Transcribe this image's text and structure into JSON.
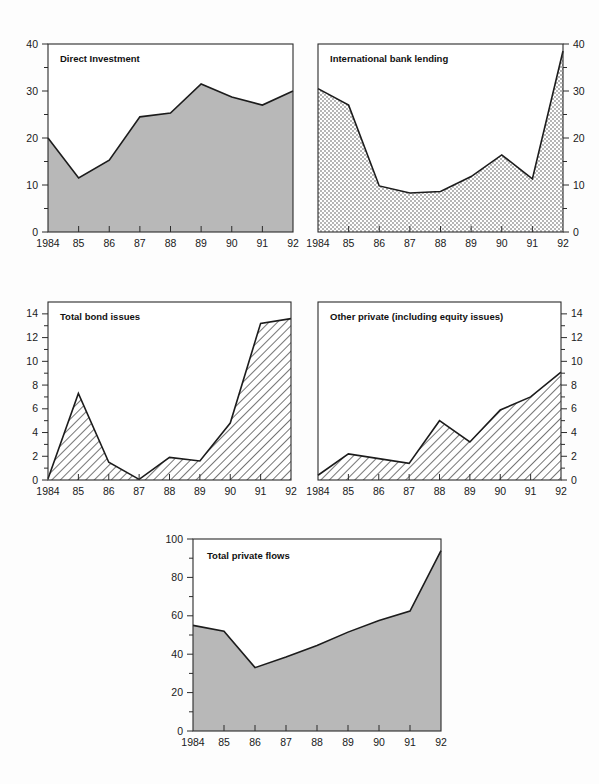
{
  "page": {
    "background_color": "#fdfdfd",
    "text_color": "#111111",
    "axis_color": "#2b2b2b",
    "solid_fill_color": "#b8b8b8",
    "line_color": "#1c1c1c"
  },
  "charts": [
    {
      "id": "direct-investment",
      "title": "Direct Investment",
      "fill_style": "solid-gray",
      "y_axis_side": "left",
      "chart_data": {
        "type": "area",
        "title": "Direct Investment",
        "xlabel": "",
        "ylabel": "",
        "categories": [
          "1984",
          "85",
          "86",
          "87",
          "88",
          "89",
          "90",
          "91",
          "92"
        ],
        "values": [
          20,
          11.5,
          15.3,
          24.5,
          25.3,
          31.5,
          28.7,
          27,
          30
        ],
        "ylim": [
          0,
          40
        ],
        "yticks": [
          0,
          10,
          20,
          30,
          40
        ],
        "yticklabels": [
          "0",
          "10",
          "20",
          "30",
          "40"
        ],
        "minor_yticks": [
          5,
          15,
          25,
          35
        ],
        "grid": false,
        "legend": "none"
      }
    },
    {
      "id": "international-bank-lending",
      "title": "International bank lending",
      "fill_style": "dotted-stipple",
      "y_axis_side": "right",
      "chart_data": {
        "type": "area",
        "title": "International bank lending",
        "xlabel": "",
        "ylabel": "",
        "categories": [
          "1984",
          "85",
          "86",
          "87",
          "88",
          "89",
          "90",
          "91",
          "92"
        ],
        "values": [
          30.5,
          27,
          9.8,
          8.3,
          8.6,
          11.8,
          16.4,
          11.3,
          38.5
        ],
        "ylim": [
          0,
          40
        ],
        "yticks": [
          0,
          10,
          20,
          30,
          40
        ],
        "yticklabels": [
          "0",
          "10",
          "20",
          "30",
          "40"
        ],
        "minor_yticks": [
          5,
          15,
          25,
          35
        ],
        "grid": false,
        "legend": "none"
      }
    },
    {
      "id": "total-bond-issues",
      "title": "Total bond issues",
      "fill_style": "diagonal-hatch",
      "y_axis_side": "left",
      "chart_data": {
        "type": "area",
        "title": "Total bond issues",
        "xlabel": "",
        "ylabel": "",
        "categories": [
          "1984",
          "85",
          "86",
          "87",
          "88",
          "89",
          "90",
          "91",
          "92"
        ],
        "values": [
          0.1,
          7.3,
          1.5,
          0.05,
          1.9,
          1.6,
          4.8,
          13.2,
          13.6
        ],
        "ylim": [
          0,
          15
        ],
        "yticks": [
          0,
          2,
          4,
          6,
          8,
          10,
          12,
          14
        ],
        "yticklabels": [
          "0",
          "2",
          "4",
          "6",
          "8",
          "10",
          "12",
          "14"
        ],
        "minor_yticks": [
          1,
          3,
          5,
          7,
          9,
          11,
          13
        ],
        "grid": false,
        "legend": "none"
      }
    },
    {
      "id": "other-private",
      "title": "Other private (including equity issues)",
      "fill_style": "diagonal-hatch",
      "y_axis_side": "right",
      "chart_data": {
        "type": "area",
        "title": "Other private (including equity issues)",
        "xlabel": "",
        "ylabel": "",
        "categories": [
          "1984",
          "85",
          "86",
          "87",
          "88",
          "89",
          "90",
          "91",
          "92"
        ],
        "values": [
          0.4,
          2.2,
          1.8,
          1.4,
          5.0,
          3.2,
          5.9,
          7.0,
          9.1
        ],
        "ylim": [
          0,
          15
        ],
        "yticks": [
          0,
          2,
          4,
          6,
          8,
          10,
          12,
          14
        ],
        "yticklabels": [
          "0",
          "2",
          "4",
          "6",
          "8",
          "10",
          "12",
          "14"
        ],
        "minor_yticks": [
          1,
          3,
          5,
          7,
          9,
          11,
          13
        ],
        "grid": false,
        "legend": "none"
      }
    },
    {
      "id": "total-private-flows",
      "title": "Total private flows",
      "fill_style": "solid-gray",
      "y_axis_side": "left",
      "chart_data": {
        "type": "area",
        "title": "Total private flows",
        "xlabel": "",
        "ylabel": "",
        "categories": [
          "1984",
          "85",
          "86",
          "87",
          "88",
          "89",
          "90",
          "91",
          "92"
        ],
        "values": [
          55,
          52,
          33,
          38.5,
          44.5,
          51.5,
          57.5,
          62.5,
          94
        ],
        "ylim": [
          0,
          100
        ],
        "yticks": [
          0,
          20,
          40,
          60,
          80,
          100
        ],
        "yticklabels": [
          "0",
          "20",
          "40",
          "60",
          "80",
          "100"
        ],
        "minor_yticks": [
          10,
          30,
          50,
          70,
          90
        ],
        "grid": false,
        "legend": "none"
      }
    }
  ]
}
